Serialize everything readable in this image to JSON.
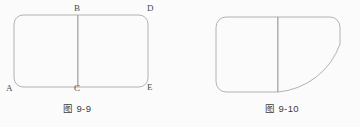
{
  "page": {
    "background_color": "#fbfbfb",
    "stroke_color": "#a9a9a9",
    "label_color": "#4a4a4a",
    "width": 360,
    "height": 127
  },
  "figures": [
    {
      "id": "figure-9-9",
      "caption": "图 9-9",
      "caption_cjk": "图",
      "caption_number": "9-9",
      "description": "Two adjoining rounded rectangles sharing a common vertical edge BC",
      "vertex_labels": [
        {
          "name": "A",
          "text": "A",
          "x": 6,
          "y": 84
        },
        {
          "name": "B",
          "text": "B",
          "x": 74,
          "y": 3
        },
        {
          "name": "C",
          "text": "C",
          "x": 74,
          "y": 84
        },
        {
          "name": "D",
          "text": "D",
          "x": 147,
          "y": 3
        },
        {
          "name": "E",
          "text": "E",
          "x": 147,
          "y": 84
        }
      ],
      "shapes": [
        {
          "name": "left-rounded-rectangle",
          "type": "rounded-rect",
          "x": 14,
          "y": 15,
          "width": 64,
          "height": 72,
          "radius": 9
        },
        {
          "name": "right-rounded-rectangle",
          "type": "rounded-rect",
          "x": 78,
          "y": 15,
          "width": 70,
          "height": 72,
          "radius": 9
        }
      ]
    },
    {
      "id": "figure-9-10",
      "caption": "图 9-10",
      "caption_cjk": "图",
      "caption_number": "9-10",
      "description": "A rounded square adjoined to a shape whose bottom-right side is a large outward arc",
      "vertex_labels": [],
      "shapes": [
        {
          "name": "rounded-square",
          "type": "rounded-rect",
          "x": 36,
          "y": 17,
          "width": 62,
          "height": 75,
          "radius": 10
        },
        {
          "name": "curved-quadrant",
          "type": "arc-shape",
          "x": 98,
          "y": 17,
          "width": 62,
          "height": 75,
          "radius": 10
        }
      ]
    }
  ],
  "captions": {
    "left": {
      "text": "图 9-9",
      "x": 90,
      "y": 105
    },
    "right": {
      "text": "图 9-10",
      "x": 270,
      "y": 105
    }
  }
}
